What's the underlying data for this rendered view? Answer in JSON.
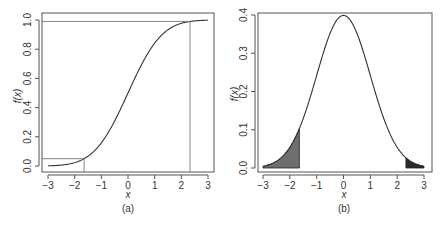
{
  "chart_data": [
    {
      "panel": "(a)",
      "type": "line",
      "title": "",
      "xlabel": "x",
      "ylabel": "f(x)",
      "caption": "(a)",
      "xlim": [
        -3,
        3
      ],
      "ylim": [
        0,
        1
      ],
      "xticks": [
        "-3",
        "-2",
        "-1",
        "0",
        "1",
        "2",
        "3"
      ],
      "yticks": [
        "0.0",
        "0.2",
        "0.4",
        "0.6",
        "0.8",
        "1.0"
      ],
      "grid": false,
      "description": "Standard normal CDF",
      "series": [
        {
          "name": "Normal CDF",
          "x": [
            -3,
            -2.5,
            -2,
            -1.645,
            -1.5,
            -1,
            -0.5,
            0,
            0.5,
            1,
            1.5,
            2,
            2.326,
            2.5,
            3
          ],
          "y": [
            0.0013,
            0.0062,
            0.0228,
            0.05,
            0.0668,
            0.1587,
            0.3085,
            0.5,
            0.6915,
            0.8413,
            0.9332,
            0.9772,
            0.99,
            0.9938,
            0.9987
          ]
        }
      ],
      "reference_lines": [
        {
          "type": "horizontal",
          "y": 0.05,
          "x_from": -3.3,
          "x_to": -1.645
        },
        {
          "type": "vertical",
          "x": -1.645,
          "y_from": 0,
          "y_to": 0.05
        },
        {
          "type": "horizontal",
          "y": 0.99,
          "x_from": -3.3,
          "x_to": 2.326
        },
        {
          "type": "vertical",
          "x": 2.326,
          "y_from": 0,
          "y_to": 0.99
        }
      ]
    },
    {
      "panel": "(b)",
      "type": "area",
      "title": "",
      "xlabel": "x",
      "ylabel": "f(x)",
      "caption": "(b)",
      "xlim": [
        -3,
        3
      ],
      "ylim": [
        0,
        0.4
      ],
      "xticks": [
        "-3",
        "-2",
        "-1",
        "0",
        "1",
        "2",
        "3"
      ],
      "yticks": [
        "0.0",
        "0.1",
        "0.2",
        "0.3",
        "0.4"
      ],
      "grid": false,
      "description": "Standard normal PDF with shaded tails",
      "series": [
        {
          "name": "Normal PDF",
          "x": [
            -3,
            -2.5,
            -2,
            -1.645,
            -1.5,
            -1,
            -0.5,
            0,
            0.5,
            1,
            1.5,
            2,
            2.326,
            2.5,
            3
          ],
          "y": [
            0.0044,
            0.0175,
            0.054,
            0.103,
            0.1295,
            0.242,
            0.3521,
            0.3989,
            0.3521,
            0.242,
            0.1295,
            0.054,
            0.0267,
            0.0175,
            0.0044
          ]
        }
      ],
      "shaded_regions": [
        {
          "name": "left tail",
          "x_from": -3,
          "x_to": -1.645,
          "color": "#6e6e6e"
        },
        {
          "name": "right tail",
          "x_from": 2.326,
          "x_to": 3,
          "color": "#2a2a2a"
        }
      ]
    }
  ],
  "panels": {
    "a": {
      "caption": "(a)",
      "xlabel": "x",
      "ylabel": "f(x)",
      "xticks": [
        "−3",
        "−2",
        "−1",
        "0",
        "1",
        "2",
        "3"
      ],
      "yticks": [
        "0.0",
        "0.2",
        "0.4",
        "0.6",
        "0.8",
        "1.0"
      ]
    },
    "b": {
      "caption": "(b)",
      "xlabel": "x",
      "ylabel": "f(x)",
      "xticks": [
        "−3",
        "−2",
        "−1",
        "0",
        "1",
        "2",
        "3"
      ],
      "yticks": [
        "0.0",
        "0.1",
        "0.2",
        "0.3",
        "0.4"
      ]
    }
  },
  "colors": {
    "axis": "#555555",
    "curve": "#333333",
    "ref_line": "#777777",
    "left_tail": "#6e6e6e",
    "right_tail": "#2a2a2a"
  }
}
